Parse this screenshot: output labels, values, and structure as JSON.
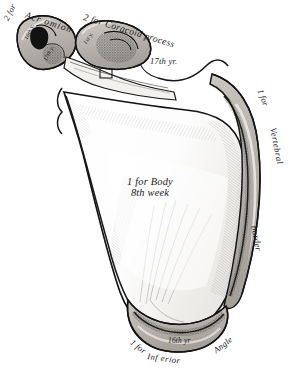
{
  "figure": {
    "view": "anterior-costal-surface",
    "background_color": "#ffffff",
    "ink_color": "#1a1a1a",
    "cartilage_tone": "#b9b5ae"
  },
  "labels": {
    "acromion_prefix": "2 for",
    "acromion": "Acr omion",
    "acromion_center_1": "16th y.",
    "acromion_center_2": "17th y.",
    "coracoid": "2 for Coracoid process",
    "coracoid_center_1": "1st y.",
    "coracoid_center_2": "17th yr.",
    "vertebral_prefix": "1 for",
    "vertebral_word": "Vertebral",
    "vertebral_border": "border",
    "body_line1": "1 for Body",
    "body_line2": "8th week",
    "inferior_prefix": "1 for",
    "inferior_word": "Inf erior",
    "inferior_angle": "Angle",
    "inferior_center": "16th yr"
  }
}
